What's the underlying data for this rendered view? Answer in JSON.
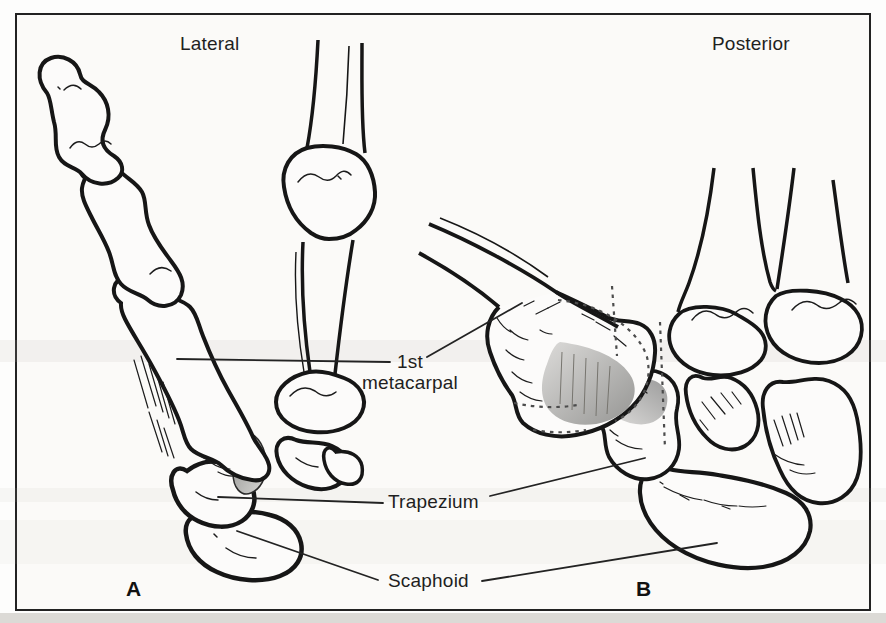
{
  "figure": {
    "type": "anatomical-diagram",
    "panels": {
      "a": {
        "view_label": "Lateral",
        "letter": "A"
      },
      "b": {
        "view_label": "Posterior",
        "letter": "B"
      }
    },
    "labels": {
      "first_metacarpal_line1": "1st",
      "first_metacarpal_line2": "metacarpal",
      "trapezium": "Trapezium",
      "scaphoid": "Scaphoid"
    },
    "colors": {
      "ink": "#1a1a1a",
      "shading_dark": "#8a8a88",
      "shading_light": "#d8d8d6",
      "paper": "#fbfaf8"
    }
  }
}
